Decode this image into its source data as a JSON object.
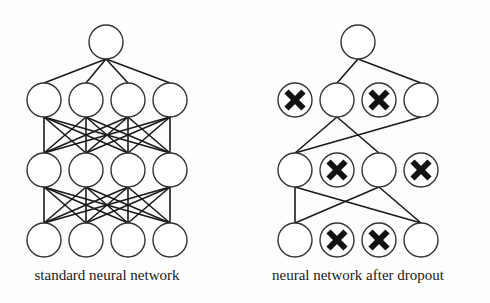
{
  "figure": {
    "left_panel": {
      "caption": "standard neural network",
      "layers": [
        1,
        4,
        4,
        4
      ],
      "connectivity": "fully-connected"
    },
    "right_panel": {
      "caption": "neural network after dropout",
      "layers": [
        1,
        4,
        4,
        4
      ],
      "dropped_nodes": {
        "layer_1": [
          0,
          2
        ],
        "layer_2": [
          1,
          3
        ],
        "layer_3": [
          1,
          2
        ]
      },
      "remaining_edges": [
        [
          "L0-0",
          "L1-1"
        ],
        [
          "L0-0",
          "L1-3"
        ],
        [
          "L1-1",
          "L2-0"
        ],
        [
          "L1-1",
          "L2-2"
        ],
        [
          "L1-3",
          "L2-0"
        ],
        [
          "L2-0",
          "L3-0"
        ],
        [
          "L2-0",
          "L3-3"
        ],
        [
          "L2-2",
          "L3-0"
        ],
        [
          "L2-2",
          "L3-3"
        ]
      ]
    },
    "colors": {
      "stroke": "#1a1a1a",
      "node_fill": "#ffffff",
      "dropped_mark": "#111111"
    }
  }
}
